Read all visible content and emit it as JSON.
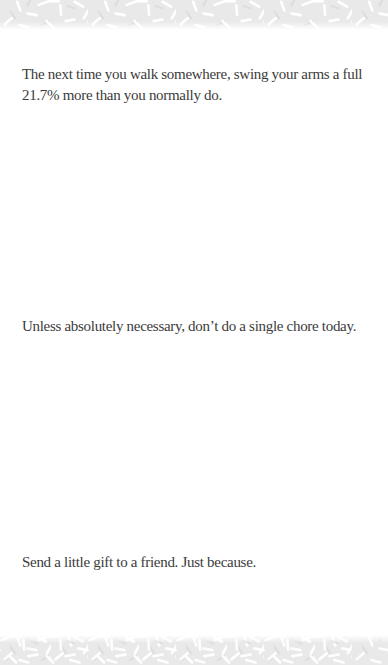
{
  "page": {
    "background_color": "#ffffff",
    "text_color": "#3b3b3b",
    "band_color": "#e9e9e9",
    "sprinkle_color": "#ffffff",
    "sprinkle_shadow_color": "#dedede"
  },
  "tips": [
    {
      "text": "The next time you walk somewhere, swing your arms a full 21.7% more than you normally do."
    },
    {
      "text": "Unless absolutely necessary, don’t do a single chore today."
    },
    {
      "text": "Send a little gift to a friend. Just because."
    }
  ]
}
